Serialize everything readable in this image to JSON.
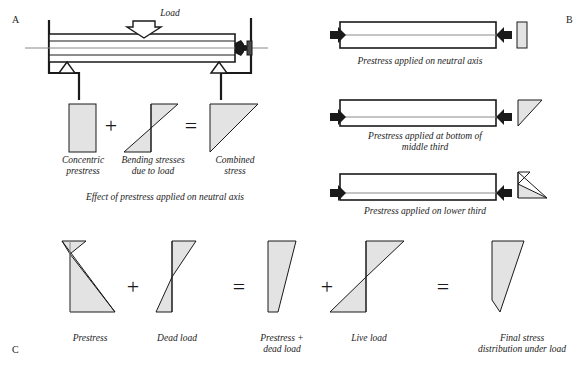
{
  "panels": {
    "a": {
      "letter": "A",
      "load_label": "Load",
      "caption": "Effect of prestress applied on neutral axis",
      "stress_blocks": [
        {
          "name": "concentric-prestress",
          "label": "Concentric\nprestress",
          "shape": "rectangle"
        },
        {
          "name": "bending-stresses",
          "label": "Bending stresses\ndue to load",
          "shape": "bowtie"
        },
        {
          "name": "combined-stress",
          "label": "Combined\nstress",
          "shape": "triangle-max-top"
        }
      ],
      "operators": [
        "+",
        "="
      ]
    },
    "b": {
      "letter": "B",
      "rows": [
        {
          "name": "neutral-axis",
          "caption": "Prestress applied on neutral axis",
          "shape": "rectangle"
        },
        {
          "name": "bottom-middle-third",
          "caption": "Prestress applied at bottom of\nmiddle third",
          "shape": "triangle-max-top"
        },
        {
          "name": "lower-third",
          "caption": "Prestress applied on lower third",
          "shape": "triangle-tension-top"
        }
      ]
    },
    "c": {
      "letter": "C",
      "items": [
        {
          "name": "prestress",
          "label": "Prestress",
          "shape": "prestress"
        },
        {
          "name": "dead-load",
          "label": "Dead load",
          "shape": "bowtie-narrow"
        },
        {
          "name": "prestress-plus-dead-load",
          "label": "Prestress +\ndead load",
          "shape": "triangle-max-top"
        },
        {
          "name": "live-load",
          "label": "Live load",
          "shape": "bowtie-wide"
        },
        {
          "name": "final-stress",
          "label": "Final stress\ndistribution under load",
          "shape": "triangle-max-top-narrow-base"
        }
      ],
      "operators": [
        "+",
        "=",
        "+",
        "="
      ]
    }
  },
  "colors": {
    "line": "#1a1a1a",
    "axis": "#8a8a8a",
    "fill": "#e8e8e8",
    "text": "#222222"
  }
}
